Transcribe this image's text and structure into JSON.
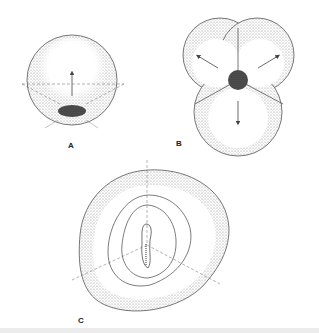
{
  "figure": {
    "panels": [
      {
        "id": "A",
        "label": "A",
        "description": "single spherical cell with dark pole region and upward arrow"
      },
      {
        "id": "B",
        "label": "B",
        "description": "three-lobed cluster with dark center and three outward arrows"
      },
      {
        "id": "C",
        "label": "C",
        "description": "rounded outer shell with concentric contours and central elongated structure"
      }
    ],
    "colors": {
      "stipple": "#9a9a9a",
      "outline": "#555555",
      "dark": "#333333",
      "background": "#ffffff"
    }
  }
}
